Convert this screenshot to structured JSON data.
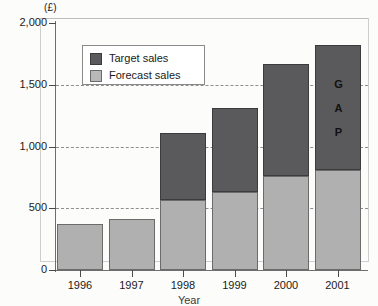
{
  "chart_data": {
    "type": "bar",
    "subtype": "stacked-column",
    "title": "",
    "xlabel": "Year",
    "ylabel": "(£)",
    "ylim": [
      0,
      2000
    ],
    "ytick_values": [
      0,
      500,
      1000,
      1500,
      2000
    ],
    "ytick_labels": [
      "0",
      "500",
      "1,000",
      "1,500",
      "2,000"
    ],
    "grid": "horizontal-dashed",
    "gridlines_at": [
      500,
      1000,
      1500
    ],
    "legend_position": "upper-left-inside",
    "categories": [
      "1996",
      "1997",
      "1998",
      "1999",
      "2000",
      "2001"
    ],
    "series": [
      {
        "name": "Forecast sales",
        "color": "#b0b0b0",
        "values": [
          370,
          410,
          570,
          630,
          760,
          810
        ]
      },
      {
        "name": "Target sales",
        "color": "#5a5a5c",
        "values": [
          0,
          0,
          540,
          680,
          910,
          1010
        ]
      }
    ],
    "totals": [
      370,
      410,
      1110,
      1310,
      1670,
      1820
    ],
    "annotations": [
      {
        "text": "GAP",
        "letters": [
          "G",
          "A",
          "P"
        ],
        "orientation": "vertical",
        "category": "2001",
        "series": "Target sales"
      }
    ]
  },
  "legend": {
    "items": [
      {
        "label": "Target sales",
        "swatch": "target-swatch"
      },
      {
        "label": "Forecast sales",
        "swatch": "forecast-swatch"
      }
    ]
  },
  "axes": {
    "y_unit_label": "(£)",
    "x_title": "Year"
  }
}
